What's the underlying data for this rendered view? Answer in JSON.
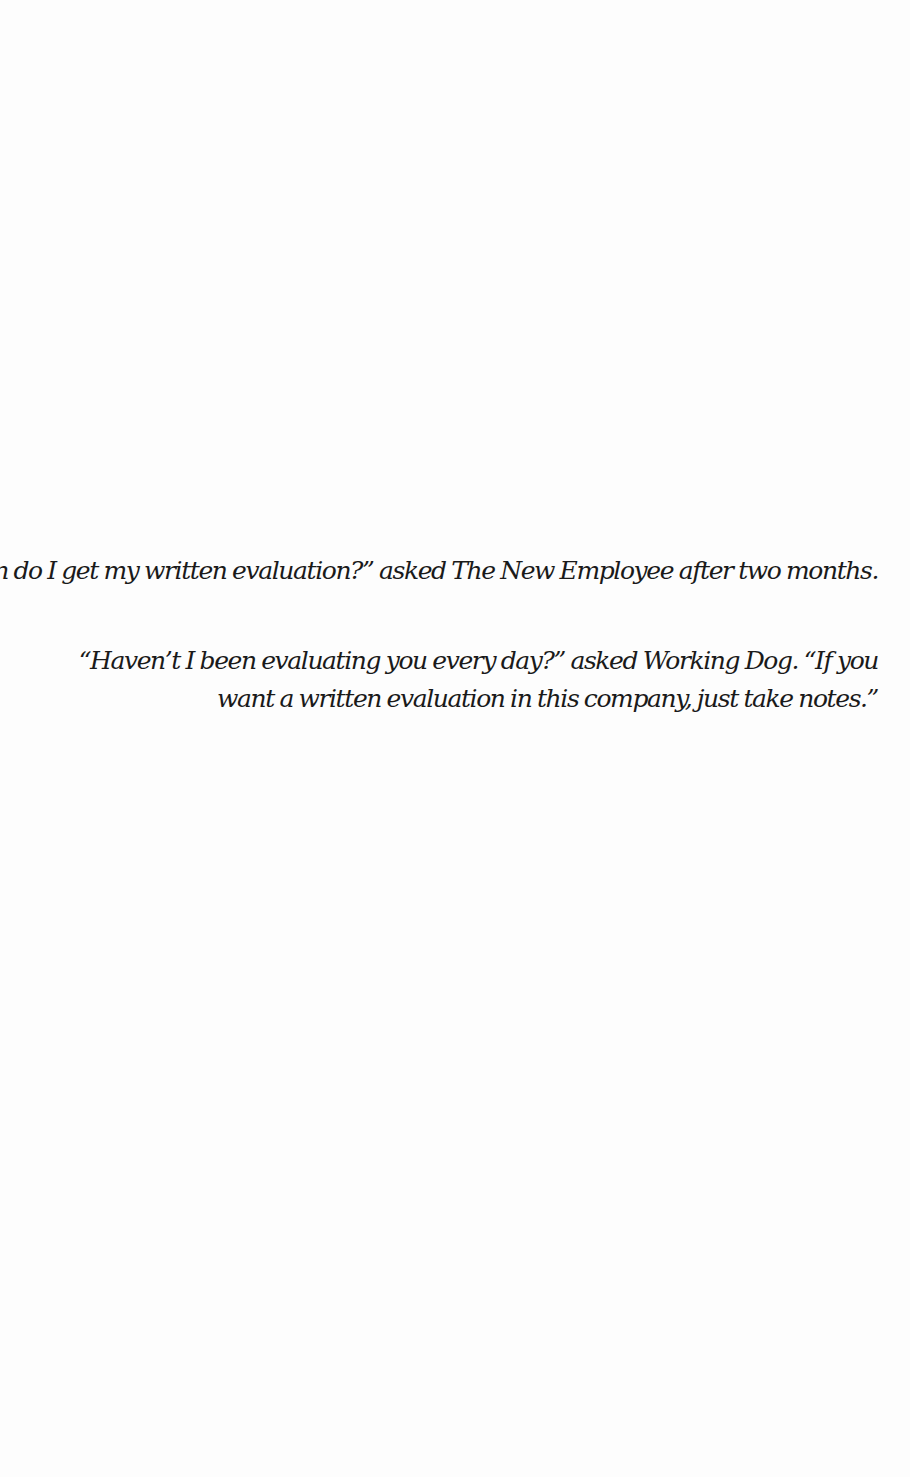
{
  "page": {
    "paragraphs": [
      {
        "lines": [
          "“When do I get my written evaluation?” asked The New Employee after two months."
        ]
      },
      {
        "lines": [
          "“Haven’t I been evaluating you every day?” asked Working Dog. “If you",
          "want a written evaluation in this company, just take notes.”"
        ]
      }
    ]
  }
}
